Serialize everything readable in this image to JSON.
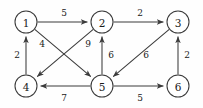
{
  "figure": {
    "type": "directed-weighted-graph",
    "background_color": "#fefefe",
    "stroke_color": "#3a3a3a",
    "text_color": "#1a1a1a",
    "node_fill": "#ffffff",
    "node_radius": 11
  },
  "nodes": [
    {
      "id": "1",
      "label": "1",
      "cx": 26,
      "cy": 22
    },
    {
      "id": "2",
      "label": "2",
      "cx": 102,
      "cy": 22
    },
    {
      "id": "3",
      "label": "3",
      "cx": 178,
      "cy": 22
    },
    {
      "id": "4",
      "label": "4",
      "cx": 26,
      "cy": 86
    },
    {
      "id": "5",
      "label": "5",
      "cx": 102,
      "cy": 86
    },
    {
      "id": "6",
      "label": "6",
      "cx": 178,
      "cy": 86
    }
  ],
  "edges": [
    {
      "id": "e-1-2",
      "from": "1",
      "to": "2",
      "weight": "5",
      "lx": 64,
      "ly": 13
    },
    {
      "id": "e-2-3",
      "from": "2",
      "to": "3",
      "weight": "2",
      "lx": 140,
      "ly": 13
    },
    {
      "id": "e-4-1",
      "from": "4",
      "to": "1",
      "weight": "2",
      "lx": 17,
      "ly": 55
    },
    {
      "id": "e-6-3",
      "from": "6",
      "to": "3",
      "weight": "2",
      "lx": 187,
      "ly": 55
    },
    {
      "id": "e-1-5",
      "from": "1",
      "to": "5",
      "weight": "4",
      "lx": 42,
      "ly": 44
    },
    {
      "id": "e-2-4",
      "from": "2",
      "to": "4",
      "weight": "9",
      "lx": 88,
      "ly": 44
    },
    {
      "id": "e-5-2",
      "from": "5",
      "to": "2",
      "weight": "6",
      "lx": 111,
      "ly": 55
    },
    {
      "id": "e-3-5",
      "from": "3",
      "to": "5",
      "weight": "6",
      "lx": 146,
      "ly": 55
    },
    {
      "id": "e-5-4",
      "from": "5",
      "to": "4",
      "weight": "7",
      "lx": 64,
      "ly": 98
    },
    {
      "id": "e-5-6",
      "from": "5",
      "to": "6",
      "weight": "5",
      "lx": 140,
      "ly": 98
    }
  ]
}
